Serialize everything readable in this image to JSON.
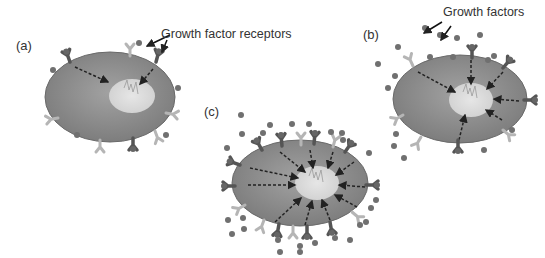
{
  "panels": [
    {
      "id": "a",
      "label": "(a)",
      "annotation": "Growth factor receptors"
    },
    {
      "id": "b",
      "label": "(b)",
      "annotation": "Growth factors"
    },
    {
      "id": "c",
      "label": "(c)"
    }
  ],
  "colors": {
    "cell": "#8e8e8e",
    "cell_edge": "#6a6a6a",
    "nucleus": "#d9d9d9",
    "receptor_light": "#b5b5b5",
    "receptor_dark": "#555555",
    "factor": "#707070",
    "arrow": "#222222"
  }
}
